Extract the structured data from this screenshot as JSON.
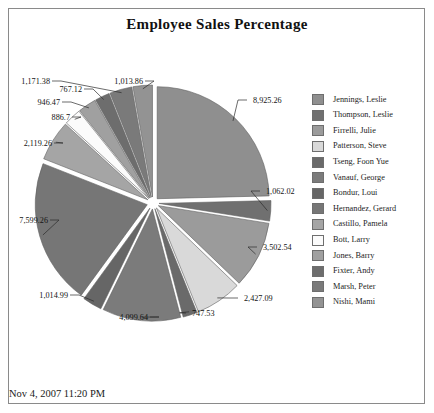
{
  "report": {
    "title": "Employee Sales Percentage",
    "timestamp": "Nov 4, 2007 11:20 PM"
  },
  "legend": {
    "items": [
      {
        "label": "Jennings, Leslie",
        "color": "#8f8f8f"
      },
      {
        "label": "Thompson, Leslie",
        "color": "#707070"
      },
      {
        "label": "Firrelli, Julie",
        "color": "#9b9b9b"
      },
      {
        "label": "Patterson, Steve",
        "color": "#d9d9d9"
      },
      {
        "label": "Tseng, Foon Yue",
        "color": "#6a6a6a"
      },
      {
        "label": "Vanauf, George",
        "color": "#7b7b7b"
      },
      {
        "label": "Bondur, Loui",
        "color": "#666666"
      },
      {
        "label": "Hernandez, Gerard",
        "color": "#767676"
      },
      {
        "label": "Castillo, Pamela",
        "color": "#a5a5a5"
      },
      {
        "label": "Bott, Larry",
        "color": "#fbfbfb"
      },
      {
        "label": "Jones, Barry",
        "color": "#a0a0a0"
      },
      {
        "label": "Fixter, Andy",
        "color": "#6d6d6d"
      },
      {
        "label": "Marsh, Peter",
        "color": "#7a7a7a"
      },
      {
        "label": "Nishi, Mami",
        "color": "#939393"
      }
    ]
  },
  "chart_data": {
    "type": "pie",
    "title": "Employee Sales Percentage",
    "exploded": true,
    "legend_position": "right",
    "categories": [
      "Jennings, Leslie",
      "Thompson, Leslie",
      "Firrelli, Julie",
      "Patterson, Steve",
      "Tseng, Foon Yue",
      "Vanauf, George",
      "Bondur, Loui",
      "Hernandez, Gerard",
      "Castillo, Pamela",
      "Bott, Larry",
      "Jones, Barry",
      "Fixter, Andy",
      "Marsh, Peter",
      "Nishi, Mami"
    ],
    "values": [
      8925.26,
      1062.02,
      3502.54,
      2427.09,
      747.53,
      4099.64,
      1014.99,
      7599.26,
      2119.26,
      886.7,
      946.47,
      767.12,
      1171.38,
      1013.86
    ],
    "labels": [
      "8,925.26",
      "1,062.02",
      "3,502.54",
      "2,427.09",
      "747.53",
      "4,099.64",
      "1,014.99",
      "7,599.26",
      "2,119.26",
      "886.7",
      "946.47",
      "767.12",
      "1,171.38",
      "1,013.86"
    ],
    "colors": [
      "#8f8f8f",
      "#707070",
      "#9b9b9b",
      "#d9d9d9",
      "#6a6a6a",
      "#7b7b7b",
      "#666666",
      "#767676",
      "#a5a5a5",
      "#fbfbfb",
      "#a0a0a0",
      "#6d6d6d",
      "#7a7a7a",
      "#939393"
    ]
  }
}
